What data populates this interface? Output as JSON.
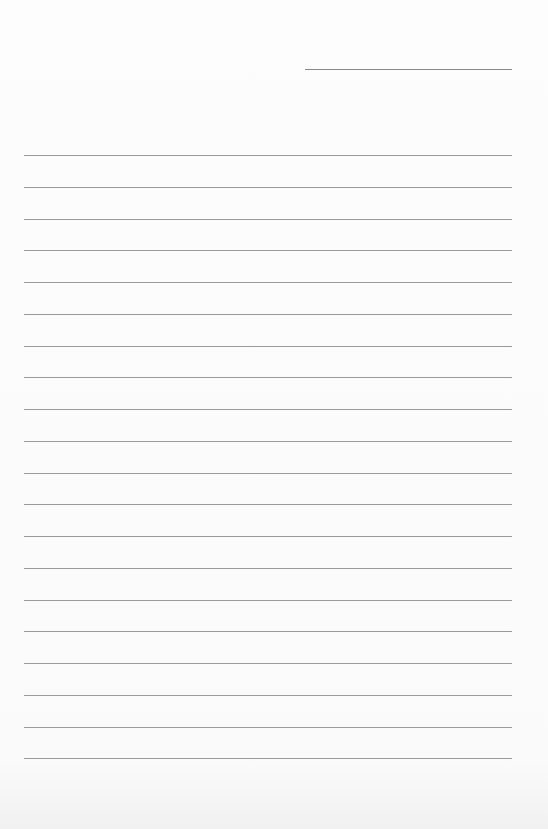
{
  "document": {
    "type": "lined-paper",
    "header": {
      "date_line": {
        "left": 305,
        "top": 69,
        "width": 207
      }
    },
    "ruled_lines": {
      "count": 20,
      "left": 24,
      "width": 488,
      "first_top": 155,
      "spacing": 31.75,
      "color": "#8f8f8f"
    },
    "paper_color": "#fbfbfb"
  }
}
